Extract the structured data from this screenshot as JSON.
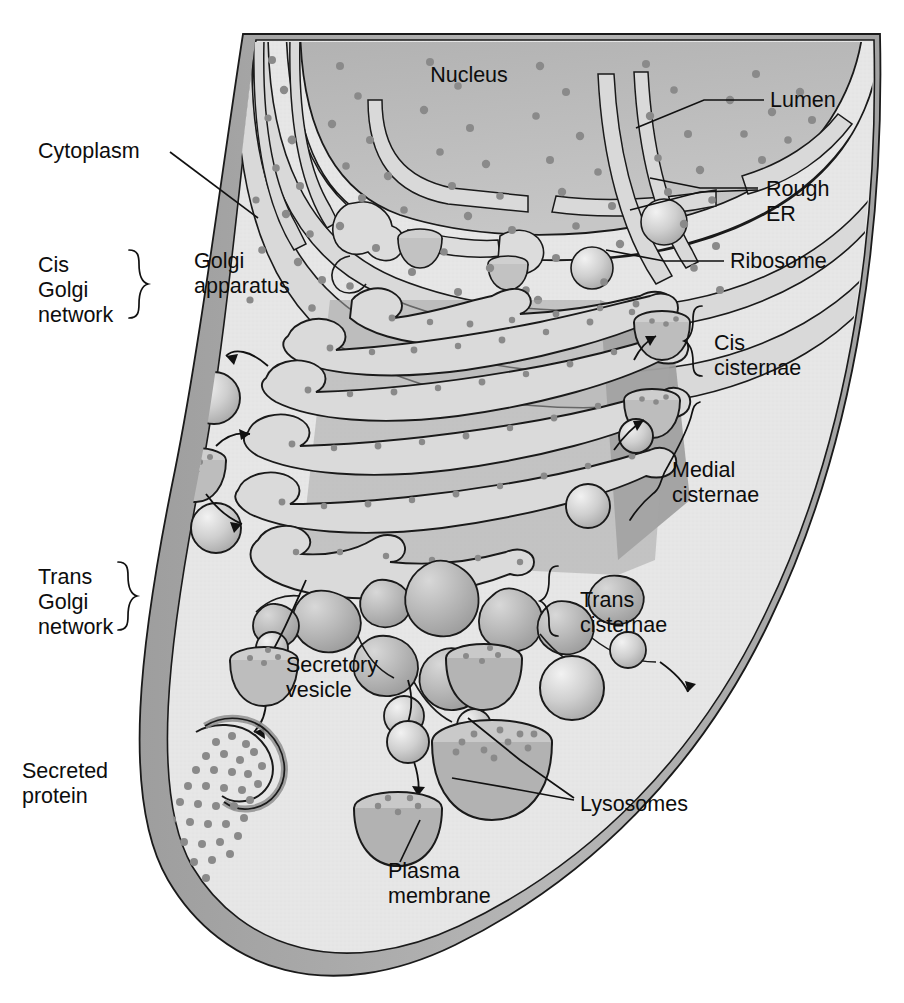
{
  "figure": {
    "type": "biological-diagram"
  },
  "colors": {
    "cytoplasm": "#e3e3e3",
    "cytoplasm_light": "#ebebeb",
    "membrane_band": "#a8a8a8",
    "nucleus": "#b4b4b4",
    "cisterna_lumen": "#d6d6d6",
    "cisterna_body": "#a9a9a9",
    "vesicle": "#c9c9c9",
    "ribosome": "#8c8c8c",
    "outline": "#1a1a1a",
    "text": "#0d0d0d"
  },
  "labels": {
    "nucleus": "Nucleus",
    "lumen": "Lumen",
    "rough_er_line1": "Rough",
    "rough_er_line2": "ER",
    "ribosome": "Ribosome",
    "cytoplasm": "Cytoplasm",
    "golgi_apparatus_line1": "Golgi",
    "golgi_apparatus_line2": "apparatus",
    "cis_golgi_network_line1": "Cis",
    "cis_golgi_network_line2": "Golgi",
    "cis_golgi_network_line3": "network",
    "trans_golgi_network_line1": "Trans",
    "trans_golgi_network_line2": "Golgi",
    "trans_golgi_network_line3": "network",
    "cis_cisternae_line1": "Cis",
    "cis_cisternae_line2": "cisternae",
    "medial_cisternae_line1": "Medial",
    "medial_cisternae_line2": "cisternae",
    "trans_cisternae_line1": "Trans",
    "trans_cisternae_line2": "cisternae",
    "secretory_vesicle_line1": "Secretory",
    "secretory_vesicle_line2": "vesicle",
    "secreted_protein_line1": "Secreted",
    "secreted_protein_line2": "protein",
    "lysosomes": "Lysosomes",
    "plasma_membrane_line1": "Plasma",
    "plasma_membrane_line2": "membrane"
  },
  "structures": {
    "cisternae_count": 6,
    "nucleus_present": true,
    "rough_er_sheets": 5,
    "lysosome_count": 4,
    "transport_vesicle_count": 6
  }
}
